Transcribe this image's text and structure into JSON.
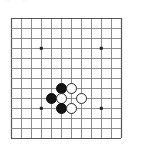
{
  "diagram": {
    "type": "go-board-diagram",
    "header": {
      "glyph_left": "◌",
      "glyph_right": "◌"
    },
    "board": {
      "background_color": "#ffffff",
      "line_color": "#808080",
      "bold_line_color": "#555555",
      "star_point_color": "#222222",
      "origin_x": 11,
      "origin_y": 18,
      "spacing": 10,
      "columns": 12,
      "rows": 13,
      "star_points": [
        {
          "col": 3,
          "row": 3
        },
        {
          "col": 9,
          "row": 3
        },
        {
          "col": 3,
          "row": 9
        },
        {
          "col": 9,
          "row": 9
        }
      ]
    },
    "stones": [
      {
        "color": "black",
        "col": 5,
        "row": 7,
        "label": "black-stone"
      },
      {
        "color": "white",
        "col": 6,
        "row": 7,
        "label": "white-stone"
      },
      {
        "color": "black",
        "col": 4,
        "row": 8,
        "label": "black-stone"
      },
      {
        "color": "white",
        "col": 5,
        "row": 8,
        "label": "white-stone"
      },
      {
        "color": "white",
        "col": 7,
        "row": 8,
        "label": "white-stone"
      },
      {
        "color": "black",
        "col": 5,
        "row": 9,
        "label": "black-stone"
      },
      {
        "color": "white",
        "col": 6,
        "row": 9,
        "label": "white-stone"
      }
    ],
    "stone_counts": {
      "black": 3,
      "white": 4
    },
    "colors": {
      "black_stone": "#141414",
      "white_stone": "#ffffff",
      "white_stone_border": "#2a2a2a",
      "grid": "#808080",
      "grid_bold": "#555555",
      "page_background": "#ffffff"
    }
  }
}
